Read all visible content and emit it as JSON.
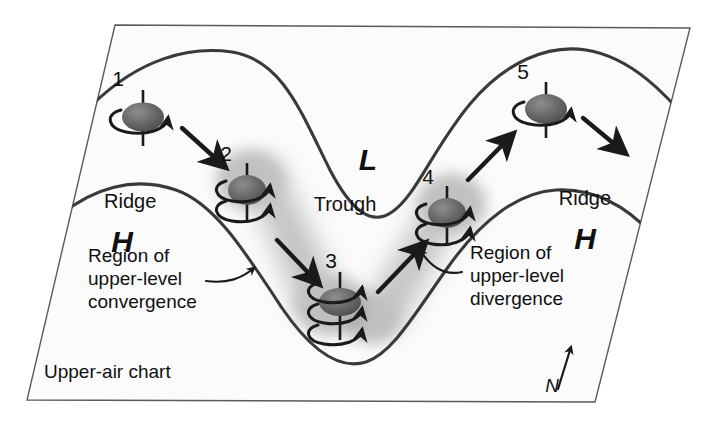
{
  "figure": {
    "kind": "upper-air-chart-diagram",
    "chart_label": "Upper-air chart",
    "compass_label": "N"
  },
  "pressure_features": {
    "ridge_left_label": "Ridge",
    "ridge_right_label": "Ridge",
    "trough_label": "Trough",
    "high_left_label": "H",
    "high_right_label": "H",
    "low_label": "L"
  },
  "annotations": {
    "convergence": {
      "line1": "Region of",
      "line2": "upper-level",
      "line3": "convergence"
    },
    "divergence": {
      "line1": "Region of",
      "line2": "upper-level",
      "line3": "divergence"
    }
  },
  "spin_markers": [
    {
      "id": "1",
      "label": "1",
      "rings": 1,
      "cx": 143,
      "cy": 117
    },
    {
      "id": "2",
      "label": "2",
      "rings": 2,
      "cx": 247,
      "cy": 190
    },
    {
      "id": "3",
      "label": "3",
      "rings": 3,
      "cx": 340,
      "cy": 302
    },
    {
      "id": "4",
      "label": "4",
      "rings": 2,
      "cx": 447,
      "cy": 213
    },
    {
      "id": "5",
      "label": "5",
      "rings": 1,
      "cx": 546,
      "cy": 109
    }
  ],
  "colors": {
    "ink": "#1a1a1a",
    "frame": "#555555",
    "panel": "#fbfbfb",
    "shade": "#b9b9b9",
    "vortex_dark": "#5d5d5d",
    "vortex_light": "#9a9a9a",
    "background": "#ffffff"
  }
}
